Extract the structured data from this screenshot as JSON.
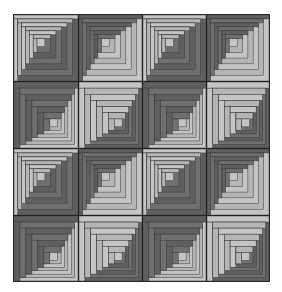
{
  "figure": {
    "rows": 4,
    "cols": 4,
    "colors": {
      "dark": "#6f6f6f",
      "darker": "#5f5f5f",
      "light": "#b5b5b5",
      "lighter": "#c4c4c4",
      "line": "#3a3a3a",
      "grid": "#222222"
    },
    "block_types_grid": [
      [
        "A",
        "B",
        "A",
        "B"
      ],
      [
        "C",
        "D",
        "C",
        "D"
      ],
      [
        "A",
        "B",
        "A",
        "B"
      ],
      [
        "C",
        "D",
        "C",
        "D"
      ]
    ],
    "block_types": {
      "A": {
        "center": "top-left",
        "top_left": "light",
        "bottom_right": "dark"
      },
      "B": {
        "center": "top-left",
        "top_left": "dark",
        "bottom_right": "light"
      },
      "C": {
        "center": "bottom-right",
        "top_left": "dark",
        "bottom_right": "light"
      },
      "D": {
        "center": "bottom-right",
        "top_left": "light",
        "bottom_right": "dark"
      }
    },
    "rings": 6
  }
}
